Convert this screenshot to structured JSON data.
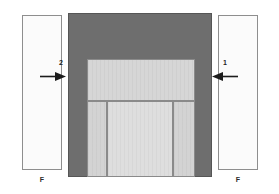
{
  "diagram": {
    "type": "cross-section-assembly",
    "background_color": "#ffffff",
    "colors": {
      "frame_dark_gray": "#6e6e6e",
      "panel_light_gray": "#d3d3d3",
      "panel_center_gray": "#dedede",
      "plate_fill": "#fbfbfb",
      "outline": "#8a8a8a",
      "text": "#1c1c1c"
    },
    "plates": [
      {
        "id": "left",
        "label": "F",
        "arrow_number": "2",
        "arrow_direction": "right"
      },
      {
        "id": "right",
        "label": "F",
        "arrow_number": "1",
        "arrow_direction": "left"
      }
    ],
    "assembly": {
      "name": "central-block",
      "regions": [
        {
          "name": "top-band",
          "fill": "#6e6e6e"
        },
        {
          "name": "left-jamb",
          "fill": "#6e6e6e"
        },
        {
          "name": "right-jamb",
          "fill": "#6e6e6e"
        },
        {
          "name": "upper-panel",
          "fill": "#d6d6d6"
        },
        {
          "name": "lower-left",
          "fill": "#d3d3d3"
        },
        {
          "name": "lower-center",
          "fill": "#dedede"
        },
        {
          "name": "lower-right",
          "fill": "#d3d3d3"
        }
      ]
    },
    "icons": {
      "arrow_left": "arrow-right-icon",
      "arrow_right": "arrow-left-icon"
    }
  }
}
